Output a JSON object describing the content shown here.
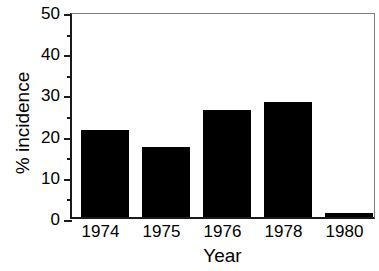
{
  "chart_data": {
    "type": "bar",
    "title": "",
    "xlabel": "Year",
    "ylabel": "% incidence",
    "categories": [
      "1974",
      "1975",
      "1976",
      "1978",
      "1980"
    ],
    "values": [
      21,
      17,
      26,
      28,
      1
    ],
    "series": [
      {
        "name": "% incidence",
        "values": [
          21,
          17,
          26,
          28,
          1
        ],
        "color": "#000000"
      }
    ],
    "ylim": [
      0,
      50
    ],
    "ytick_labels": [
      "0",
      "10",
      "20",
      "30",
      "40",
      "50"
    ],
    "ytick_values": [
      0,
      10,
      20,
      30,
      40,
      50
    ],
    "yminor_values": [
      5,
      15,
      25,
      35,
      45
    ],
    "ytick_major_interval": 10,
    "ytick_minor_interval": 5,
    "grid": false,
    "legend": false,
    "legend_position": "none",
    "bar_color": "#000000",
    "axis_color": "#1a1a1a",
    "frame_color": "#808080",
    "background": "#ffffff"
  }
}
